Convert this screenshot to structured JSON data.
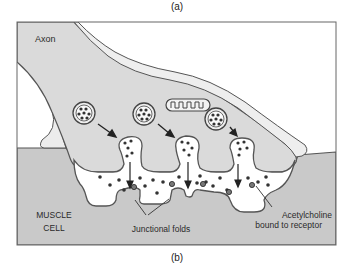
{
  "panel_labels": {
    "top": "(a)",
    "bottom": "(b)"
  },
  "labels": {
    "axon": "Axon",
    "muscle_cell_line1": "MUSCLE",
    "muscle_cell_line2": "CELL",
    "junctional_folds": "Junctional folds",
    "ach_line1": "Acetylcholine",
    "ach_line2": "bound to receptor"
  },
  "colors": {
    "background": "#ffffff",
    "axon_fill": "#dcdcdc",
    "muscle_fill": "#c8c8c8",
    "cleft_fill": "#ffffff",
    "membrane": "#555555",
    "dots": "#333333",
    "frame": "#666666"
  },
  "elements": {
    "vesicles": 3,
    "fusing_vesicles": 3,
    "mitochondrion": 1
  }
}
